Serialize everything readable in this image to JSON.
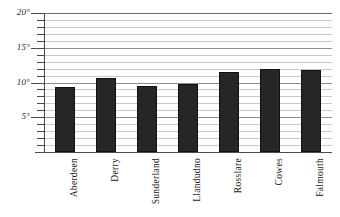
{
  "chart_data": {
    "type": "bar",
    "title": "",
    "subtitle": "",
    "xlabel": "",
    "ylabel": "",
    "categories": [
      "Aberdeen",
      "Derry",
      "Sunderland",
      "Llandudno",
      "Rosslare",
      "Cowes",
      "Falmouth"
    ],
    "values": [
      9.4,
      10.7,
      9.5,
      9.8,
      11.5,
      12.0,
      11.8
    ],
    "unit": "°",
    "ylim": [
      0,
      20
    ],
    "y_major_ticks": [
      5,
      10,
      15,
      20
    ],
    "y_major_tick_labels": [
      "5°",
      "10°",
      "15°",
      "20°"
    ],
    "y_minor_tick_interval": 1,
    "grid": true,
    "grid_orientation": "horizontal",
    "legend": "none",
    "bar_color": "#262626",
    "grid_color": "#c9c9c9",
    "grid_major_color": "#8d8d8d",
    "axis_color": "#4a4a4a",
    "background": "#ffffff"
  }
}
